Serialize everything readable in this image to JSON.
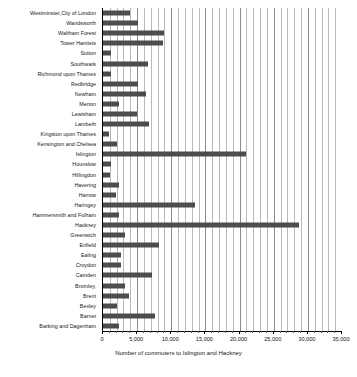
{
  "chart_data": {
    "type": "bar",
    "orientation": "horizontal",
    "title": "",
    "xlabel": "Number of commuters to Islington and Hackney",
    "ylabel": "",
    "xlim": [
      0,
      35000
    ],
    "xticks": [
      0,
      5000,
      10000,
      15000,
      20000,
      25000,
      30000,
      35000
    ],
    "xticklabels": [
      "0",
      "5,000",
      "10,000",
      "15,000",
      "20,000",
      "25,000",
      "30,000",
      "35,000"
    ],
    "minor_tick_interval": 1000,
    "grid": "vertical",
    "legend": "none",
    "bar_color": "#4c4c4c",
    "categories": [
      "Westminster,City of London",
      "Wandsworth",
      "Waltham Forest",
      "Tower Hamlets",
      "Sutton",
      "Southwark",
      "Richmond upon Thames",
      "Redbridge",
      "Newham",
      "Merton",
      "Lewisham",
      "Lambeth",
      "Kingston upon Thames",
      "Kensington and Chelsea",
      "Islington",
      "Hounslow",
      "Hillingdon",
      "Havering",
      "Harrow",
      "Haringey",
      "Hammersmith and Fulham",
      "Hackney",
      "Greenwich",
      "Enfield",
      "Ealing",
      "Croydon",
      "Camden",
      "Bromley,",
      "Brent",
      "Bexley",
      "Barnet",
      "Barking and Dagenham"
    ],
    "values": [
      4000,
      5100,
      8900,
      8800,
      1200,
      6600,
      1200,
      5100,
      6300,
      2300,
      5000,
      6700,
      900,
      2000,
      21000,
      1200,
      1000,
      2300,
      1900,
      13500,
      2400,
      28700,
      3200,
      8200,
      2600,
      2600,
      7200,
      3200,
      3800,
      2000,
      7600,
      2400
    ]
  }
}
